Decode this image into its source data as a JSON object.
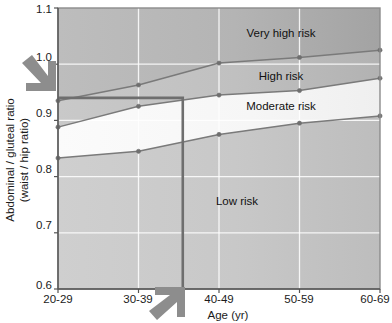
{
  "figure": {
    "cut_off_title": "",
    "background": "#ffffff"
  },
  "axes": {
    "x": {
      "title": "Age (yr)",
      "categories": [
        "20-29",
        "30-39",
        "40-49",
        "50-59",
        "60-69"
      ]
    },
    "y": {
      "title_line1": "Abdominal / gluteal ratio",
      "title_line2": "(waist / hip ratio)",
      "ticks": [
        "1.1",
        "1.0",
        "0.9",
        "0.8",
        "0.7",
        "0.6"
      ],
      "min": 0.6,
      "max": 1.1
    }
  },
  "zones": [
    {
      "name": "very-high-risk",
      "label": "Very high risk",
      "fill": "#b0b0b0"
    },
    {
      "name": "high-risk",
      "label": "High risk",
      "fill": "#bebebe"
    },
    {
      "name": "moderate-risk",
      "label": "Moderate risk",
      "fill": "#f4f4f4"
    },
    {
      "name": "low-risk",
      "label": "Low risk",
      "fill": "#c6c6c6"
    }
  ],
  "annotations": {
    "reference_value": "0.94",
    "left_arrow": "down-right-arrow-icon",
    "bottom_arrow": "up-right-arrow-icon",
    "reference_line_color": "#6e6e6e"
  },
  "chart_data": {
    "type": "line",
    "title": "",
    "xlabel": "Age (yr)",
    "ylabel": "Abdominal / gluteal ratio (waist / hip ratio)",
    "categories": [
      "20-29",
      "30-39",
      "40-49",
      "50-59",
      "60-69"
    ],
    "ylim": [
      0.6,
      1.1
    ],
    "yticks": [
      0.6,
      0.7,
      0.8,
      0.9,
      1.0,
      1.1
    ],
    "grid": true,
    "legend": "none",
    "marker": "circle",
    "series": [
      {
        "name": "Very high risk / High risk boundary",
        "values": [
          0.935,
          0.963,
          1.002,
          1.012,
          1.025
        ],
        "color": "#7a7a7a"
      },
      {
        "name": "High risk / Moderate risk boundary",
        "values": [
          0.888,
          0.925,
          0.945,
          0.953,
          0.975
        ],
        "color": "#7a7a7a"
      },
      {
        "name": "Moderate risk / Low risk boundary",
        "values": [
          0.833,
          0.845,
          0.875,
          0.895,
          0.908
        ],
        "color": "#7a7a7a"
      }
    ],
    "zone_annotations": [
      {
        "label": "Very high risk",
        "x": "50-59",
        "y": 1.06
      },
      {
        "label": "High risk",
        "x": "50-59",
        "y": 0.978
      },
      {
        "label": "Moderate risk",
        "x": "50-59",
        "y": 0.925
      },
      {
        "label": "Low risk",
        "x": "40-49",
        "y": 0.745
      }
    ],
    "reference_lines": [
      {
        "orientation": "horizontal",
        "value": 0.94,
        "from_x": "20-29",
        "to_x": 1.55
      },
      {
        "orientation": "vertical",
        "value": 1.55,
        "from_y": 0.6,
        "to_y": 0.94
      }
    ]
  }
}
